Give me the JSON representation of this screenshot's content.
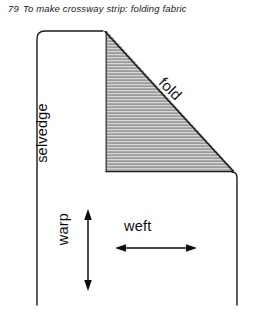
{
  "caption": {
    "number": "79",
    "text": "To make crossway strip: folding fabric"
  },
  "diagram": {
    "labels": {
      "selvedge": "selvedge",
      "warp": "warp",
      "weft": "weft",
      "fold": "fold"
    },
    "colors": {
      "outline": "#1a1a1a",
      "fold_fill": "#9a9a9a",
      "hatch": "#d8d8d8",
      "background": "#ffffff"
    }
  }
}
